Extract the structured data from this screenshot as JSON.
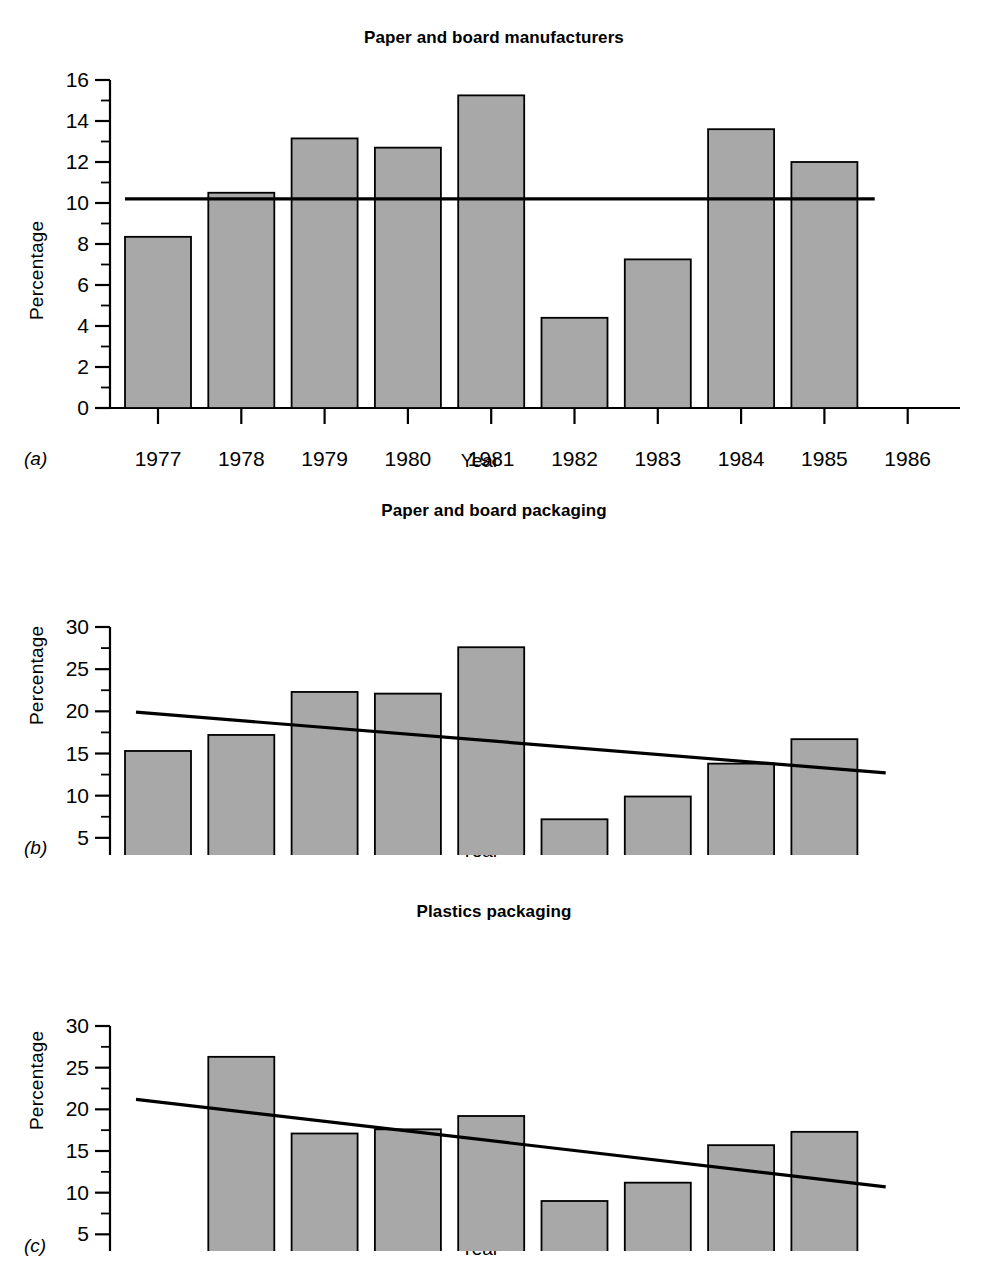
{
  "figure": {
    "background": "#ffffff",
    "bar_fill": "#a8a8a8",
    "bar_stroke": "#000000",
    "axis_color": "#000000",
    "trend_color": "#000000"
  },
  "panels": [
    {
      "letter": "(a)",
      "title": "Paper and board manufacturers",
      "ylabel": "Percentage",
      "xlabel": "Year"
    },
    {
      "letter": "(b)",
      "title": "Paper and board packaging",
      "ylabel": "Percentage",
      "xlabel": "Year"
    },
    {
      "letter": "(c)",
      "title": "Plastics packaging",
      "ylabel": "Percentage",
      "xlabel": "Year"
    }
  ],
  "chart_data": [
    {
      "type": "bar",
      "title": "Paper and board manufacturers",
      "xlabel": "Year",
      "ylabel": "Percentage",
      "categories": [
        "1977",
        "1978",
        "1979",
        "1980",
        "1981",
        "1982",
        "1983",
        "1984",
        "1985",
        "1986"
      ],
      "values": [
        8.35,
        10.5,
        13.15,
        12.7,
        15.25,
        4.4,
        7.25,
        13.6,
        12.0,
        null
      ],
      "ylim": [
        0,
        16
      ],
      "yticks": [
        0,
        2,
        4,
        6,
        8,
        10,
        12,
        14,
        16
      ],
      "ytick_labels": [
        "0",
        "2",
        "4",
        "6",
        "8",
        "10",
        "12",
        "14",
        "16"
      ],
      "yminor_step": 1,
      "grid": false,
      "legend": "none",
      "annotations": [
        {
          "kind": "reference-line",
          "orientation": "horizontal",
          "value": 10.2,
          "x_start": "1977",
          "x_end": "1986"
        }
      ]
    },
    {
      "type": "bar",
      "title": "Paper and board packaging",
      "xlabel": "Year",
      "ylabel": "Percentage",
      "categories": [
        "1977",
        "1978",
        "1979",
        "1980",
        "1981",
        "1982",
        "1983",
        "1984",
        "1985",
        "1986"
      ],
      "values": [
        15.3,
        17.2,
        22.3,
        22.1,
        27.6,
        7.2,
        9.9,
        13.8,
        16.7,
        null
      ],
      "ylim": [
        0,
        30
      ],
      "yticks": [
        0,
        5,
        10,
        15,
        20,
        25,
        30
      ],
      "ytick_labels": [
        "0",
        "5",
        "10",
        "15",
        "20",
        "25",
        "30"
      ],
      "yminor_step": 2.5,
      "grid": false,
      "legend": "none",
      "annotations": [
        {
          "kind": "trend-line",
          "x_start": "1977",
          "x_end": "1986",
          "y_start": 19.9,
          "y_end": 12.7
        }
      ]
    },
    {
      "type": "bar",
      "title": "Plastics packaging",
      "xlabel": "Year",
      "ylabel": "Percentage",
      "categories": [
        "1977",
        "1978",
        "1979",
        "1980",
        "1981",
        "1982",
        "1983",
        "1984",
        "1985",
        "1986"
      ],
      "values": [
        null,
        26.3,
        17.1,
        17.6,
        19.2,
        9.0,
        11.2,
        15.7,
        17.3,
        null
      ],
      "ylim": [
        0,
        30
      ],
      "yticks": [
        0,
        5,
        10,
        15,
        20,
        25,
        30
      ],
      "ytick_labels": [
        "0",
        "5",
        "10",
        "15",
        "20",
        "25",
        "30"
      ],
      "yminor_step": 2.5,
      "grid": false,
      "legend": "none",
      "annotations": [
        {
          "kind": "trend-line",
          "x_start": "1977",
          "x_end": "1986",
          "y_start": 21.2,
          "y_end": 10.7
        }
      ]
    }
  ]
}
